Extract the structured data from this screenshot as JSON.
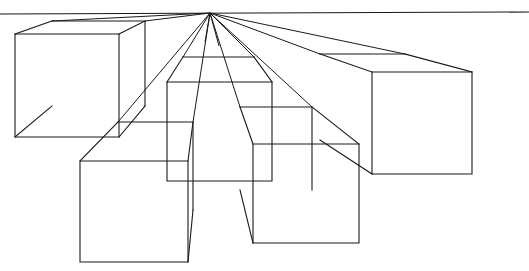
{
  "document": {
    "title": "One-Point Perspective Boxes",
    "kind": "line-drawing",
    "background_color": "#ffffff",
    "stroke_color": "#1a1a1a",
    "width": 529,
    "height": 271
  },
  "scene": {
    "vanishing_point": {
      "x": 210,
      "y": 13
    },
    "horizon": {
      "x1": 0,
      "y1": 14,
      "x2": 529,
      "y2": 12,
      "label": "horizon-line"
    },
    "box_count": 5,
    "ray_count": 12
  },
  "boxes": [
    {
      "name": "top-left-box",
      "front": {
        "x": 15,
        "y": 34,
        "w": 104,
        "h": 103
      },
      "back": {
        "x": 52,
        "y": 21,
        "w": 93,
        "h": 85
      },
      "front_points": "15,34 119,34 119,137 15,137",
      "back_points": "52,21 145,21 145,106 52,106",
      "connectors": [
        {
          "x1": 15,
          "y1": 34,
          "x2": 52,
          "y2": 21
        },
        {
          "x1": 119,
          "y1": 34,
          "x2": 145,
          "y2": 21
        },
        {
          "x1": 119,
          "y1": 137,
          "x2": 145,
          "y2": 106
        },
        {
          "x1": 15,
          "y1": 137,
          "x2": 52,
          "y2": 106
        }
      ],
      "visible_back_edges": "52,21 145,21 145,106"
    },
    {
      "name": "center-box",
      "front": {
        "x": 167,
        "y": 82,
        "w": 105,
        "h": 99
      },
      "back": {
        "x": 183,
        "y": 57,
        "w": 71,
        "h": 68
      },
      "front_points": "167,82 272,82 272,181 167,181",
      "back_points": "183,57 254,57 254,125 183,125",
      "connectors": [
        {
          "x1": 167,
          "y1": 82,
          "x2": 183,
          "y2": 57
        },
        {
          "x1": 272,
          "y1": 82,
          "x2": 254,
          "y2": 57
        }
      ],
      "visible_back_edges": "183,57 254,57"
    },
    {
      "name": "right-box",
      "front": {
        "x": 372,
        "y": 72,
        "w": 100,
        "h": 102
      },
      "back": {
        "x": 320,
        "y": 54,
        "w": 85,
        "h": 86
      },
      "front_points": "372,72 472,72 472,174 372,174",
      "back_points": "320,54 405,54 405,140 320,140",
      "connectors": [
        {
          "x1": 372,
          "y1": 72,
          "x2": 320,
          "y2": 54
        },
        {
          "x1": 472,
          "y1": 72,
          "x2": 405,
          "y2": 54
        },
        {
          "x1": 372,
          "y1": 174,
          "x2": 320,
          "y2": 140
        }
      ],
      "visible_back_edges": "320,54 405,54"
    },
    {
      "name": "lower-left-box",
      "front": {
        "x": 80,
        "y": 161,
        "w": 108,
        "h": 101
      },
      "back": {
        "x": 118,
        "y": 122,
        "w": 75,
        "h": 88
      },
      "front_points": "80,161 188,161 188,262 80,262",
      "back_points": "118,122 193,122 193,210 118,210",
      "connectors": [
        {
          "x1": 80,
          "y1": 161,
          "x2": 118,
          "y2": 122
        },
        {
          "x1": 188,
          "y1": 161,
          "x2": 193,
          "y2": 122
        },
        {
          "x1": 188,
          "y1": 262,
          "x2": 193,
          "y2": 210
        }
      ],
      "visible_back_edges": "118,122 193,122 193,210"
    },
    {
      "name": "lower-right-box",
      "front": {
        "x": 253,
        "y": 144,
        "w": 106,
        "h": 99
      },
      "back": {
        "x": 240,
        "y": 107,
        "w": 72,
        "h": 83
      },
      "front_points": "253,144 359,144 359,243 253,243",
      "back_points": "240,107 312,107 312,190 240,190",
      "connectors": [
        {
          "x1": 253,
          "y1": 144,
          "x2": 240,
          "y2": 107
        },
        {
          "x1": 359,
          "y1": 144,
          "x2": 312,
          "y2": 107
        },
        {
          "x1": 253,
          "y1": 243,
          "x2": 240,
          "y2": 190
        }
      ],
      "visible_back_edges": "240,107 312,107 312,190"
    }
  ],
  "rays": [
    {
      "name": "ray-to-topleft-back-left",
      "x1": 210,
      "y1": 13,
      "x2": 52,
      "y2": 21
    },
    {
      "name": "ray-to-topleft-back-right",
      "x1": 210,
      "y1": 13,
      "x2": 145,
      "y2": 21
    },
    {
      "name": "ray-to-lowerleft-back-left",
      "x1": 210,
      "y1": 13,
      "x2": 118,
      "y2": 122
    },
    {
      "name": "ray-to-lowerleft-back-right",
      "x1": 210,
      "y1": 13,
      "x2": 193,
      "y2": 122
    },
    {
      "name": "ray-to-center-back-left",
      "x1": 210,
      "y1": 13,
      "x2": 183,
      "y2": 57
    },
    {
      "name": "ray-stub-left",
      "x1": 210,
      "y1": 13,
      "x2": 205,
      "y2": 42
    },
    {
      "name": "ray-stub-right",
      "x1": 210,
      "y1": 13,
      "x2": 219,
      "y2": 46
    },
    {
      "name": "ray-to-center-back-right",
      "x1": 210,
      "y1": 13,
      "x2": 254,
      "y2": 57
    },
    {
      "name": "ray-to-lowerright-back-left",
      "x1": 210,
      "y1": 13,
      "x2": 240,
      "y2": 107
    },
    {
      "name": "ray-to-lowerright-back-right",
      "x1": 210,
      "y1": 13,
      "x2": 312,
      "y2": 107
    },
    {
      "name": "ray-to-right-back-left",
      "x1": 210,
      "y1": 13,
      "x2": 320,
      "y2": 54
    },
    {
      "name": "ray-to-right-back-right",
      "x1": 210,
      "y1": 13,
      "x2": 405,
      "y2": 54
    }
  ]
}
